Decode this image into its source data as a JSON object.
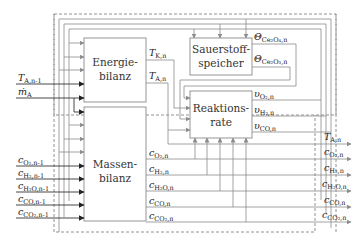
{
  "blocks": {
    "energy": {
      "line1": "Energie-",
      "line2": "bilanz"
    },
    "mass": {
      "line1": "Massen-",
      "line2": "bilanz"
    },
    "storage": {
      "line1": "Sauerstoff-",
      "line2": "speicher"
    },
    "reaction": {
      "line1": "Reaktions-",
      "line2": "rate"
    }
  },
  "inputs": {
    "T_A_prev": {
      "main": "T",
      "sub": "A,n-1"
    },
    "m_A": {
      "main": "ṁ",
      "sub": "A"
    },
    "c_prev": [
      {
        "main": "c",
        "sub": "O₂,n-1"
      },
      {
        "main": "c",
        "sub": "H₂,n-1"
      },
      {
        "main": "c",
        "sub": "H₂O,n-1"
      },
      {
        "main": "c",
        "sub": "CO,n-1"
      },
      {
        "main": "c",
        "sub": "CO₂,n-1"
      }
    ]
  },
  "energy_outputs": [
    {
      "main": "T",
      "sub": "K,n"
    },
    {
      "main": "T",
      "sub": "A,n"
    }
  ],
  "storage_outputs": [
    {
      "main": "Θ",
      "sub": "Ce₂O₄,n"
    },
    {
      "main": "Θ",
      "sub": "Ce₂O₃,n"
    }
  ],
  "reaction_outputs": [
    {
      "main": "υ",
      "sub": "O₂,n"
    },
    {
      "main": "υ",
      "sub": "H₂,n"
    },
    {
      "main": "υ",
      "sub": "CO,n"
    }
  ],
  "mass_outputs": [
    {
      "main": "c",
      "sub": "O₂,n"
    },
    {
      "main": "c",
      "sub": "H₂,n"
    },
    {
      "main": "c",
      "sub": "H₂O,n"
    },
    {
      "main": "c",
      "sub": "CO,n"
    },
    {
      "main": "c",
      "sub": "CO₂,n"
    }
  ],
  "outputs": [
    {
      "main": "T",
      "sub": "A,n"
    },
    {
      "main": "c",
      "sub": "O₂,n"
    },
    {
      "main": "c",
      "sub": "H₂,n"
    },
    {
      "main": "c",
      "sub": "H₂O,n"
    },
    {
      "main": "c",
      "sub": "CO,n"
    },
    {
      "main": "c",
      "sub": "CO₂,n"
    }
  ]
}
